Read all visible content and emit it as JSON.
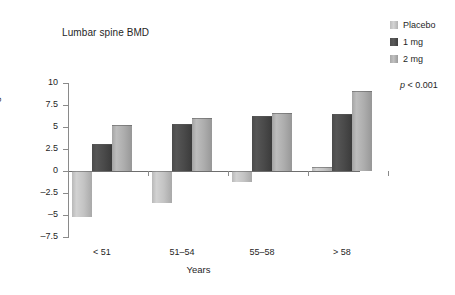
{
  "chart_data": {
    "type": "bar",
    "title": "Lumbar spine BMD",
    "xlabel": "Years",
    "ylabel": "% change",
    "categories": [
      "< 51",
      "51–54",
      "55–58",
      "> 58"
    ],
    "series": [
      {
        "name": "Placebo",
        "color": "#c3c3c3",
        "values": [
          -5.2,
          -3.6,
          -1.2,
          0.5
        ]
      },
      {
        "name": "1 mg",
        "color": "#4a4a4a",
        "values": [
          3.1,
          5.3,
          6.2,
          6.5
        ]
      },
      {
        "name": "2 mg",
        "color": "#adadad",
        "values": [
          5.2,
          6.0,
          6.6,
          9.1
        ]
      }
    ],
    "ylim": [
      -7.5,
      10
    ],
    "yticks": [
      10,
      7.5,
      5,
      2.5,
      0,
      -2.5,
      -5,
      -7.5
    ],
    "ytick_labels": [
      "10",
      "7.5",
      "5",
      "2.5",
      "0",
      "–2.5",
      "–5",
      "–7.5"
    ],
    "grid": false,
    "legend_position": "right",
    "annotations": [
      {
        "name": "p-value",
        "text_prefix": "p",
        "text_suffix": " < 0.001"
      }
    ]
  },
  "legend": {
    "items": [
      {
        "label": "Placebo",
        "swatch": "placebo"
      },
      {
        "label": "1 mg",
        "swatch": "dose1"
      },
      {
        "label": "2 mg",
        "swatch": "dose2"
      }
    ]
  },
  "pvalue": {
    "symbol": "p",
    "rest": " < 0.001"
  }
}
